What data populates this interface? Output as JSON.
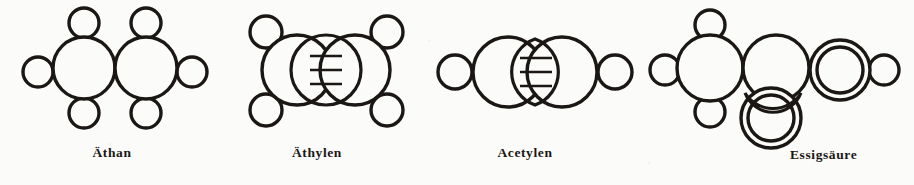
{
  "figure": {
    "background_color": "#fbfbfa",
    "ink_color": "#1a1714",
    "atom_fill": "#fbfbfa",
    "width": 914,
    "height": 185
  },
  "panels": [
    {
      "id": "aethan",
      "caption": "Äthan",
      "formula_note": "C2H6",
      "bond_type": "single",
      "carbon_count": 2,
      "hydrogen_count": 6,
      "oxygen_count": 0,
      "carbons": [
        {
          "cx": 84,
          "cy": 68,
          "r": 31,
          "rings": 1
        },
        {
          "cx": 146,
          "cy": 68,
          "r": 31,
          "rings": 1
        }
      ],
      "hydrogens": [
        {
          "cx": 84,
          "cy": 23,
          "r": 15
        },
        {
          "cx": 84,
          "cy": 113,
          "r": 15
        },
        {
          "cx": 38,
          "cy": 72,
          "r": 15
        },
        {
          "cx": 192,
          "cy": 72,
          "r": 15
        },
        {
          "cx": 146,
          "cy": 23,
          "r": 15
        },
        {
          "cx": 146,
          "cy": 113,
          "r": 15
        }
      ],
      "hatched_lens": null,
      "caption_x": 115,
      "caption_y": 150
    },
    {
      "id": "aethylen",
      "caption": "Äthylen",
      "formula_note": "C2H4",
      "bond_type": "double",
      "carbon_count": 2,
      "hydrogen_count": 4,
      "oxygen_count": 0,
      "carbons": [
        {
          "cx": 297,
          "cy": 70,
          "r": 35,
          "rings": 1
        },
        {
          "cx": 355,
          "cy": 70,
          "r": 35,
          "rings": 1
        }
      ],
      "hydrogens": [
        {
          "cx": 266,
          "cy": 32,
          "r": 16
        },
        {
          "cx": 266,
          "cy": 110,
          "r": 16
        },
        {
          "cx": 387,
          "cy": 32,
          "r": 16
        },
        {
          "cx": 387,
          "cy": 110,
          "r": 16
        }
      ],
      "hatched_lens": {
        "cx": 326,
        "cy": 70,
        "orientation": "vertical",
        "lines": 3
      },
      "caption_x": 326,
      "caption_y": 150
    },
    {
      "id": "acetylen",
      "caption": "Acetylen",
      "formula_note": "C2H2",
      "bond_type": "triple",
      "carbon_count": 2,
      "hydrogen_count": 2,
      "oxygen_count": 0,
      "carbons": [
        {
          "cx": 508,
          "cy": 72,
          "r": 35,
          "rings": 1
        },
        {
          "cx": 562,
          "cy": 72,
          "r": 35,
          "rings": 1
        }
      ],
      "hydrogens": [
        {
          "cx": 455,
          "cy": 72,
          "r": 17
        },
        {
          "cx": 615,
          "cy": 72,
          "r": 17
        }
      ],
      "hatched_lens": {
        "cx": 535,
        "cy": 72,
        "orientation": "vertical",
        "lines": 3
      },
      "caption_x": 535,
      "caption_y": 150
    },
    {
      "id": "essigsaeure",
      "caption": "Essigsäure",
      "formula_note": "CH3COOH",
      "bond_type": "mixed",
      "carbon_count": 2,
      "hydrogen_count": 4,
      "oxygen_count": 2,
      "carbons": [
        {
          "cx": 710,
          "cy": 68,
          "r": 33,
          "rings": 1
        },
        {
          "cx": 776,
          "cy": 68,
          "r": 33,
          "rings": 1
        }
      ],
      "hydrogens": [
        {
          "cx": 710,
          "cy": 25,
          "r": 15
        },
        {
          "cx": 710,
          "cy": 112,
          "r": 15
        },
        {
          "cx": 665,
          "cy": 70,
          "r": 15
        },
        {
          "cx": 884,
          "cy": 70,
          "r": 15
        }
      ],
      "oxygens": [
        {
          "cx": 840,
          "cy": 70,
          "r_outer": 30,
          "r_inner": 23,
          "rings": 2
        },
        {
          "cx": 771,
          "cy": 118,
          "r_outer": 30,
          "r_inner": 23,
          "rings": 2
        }
      ],
      "hatched_lens": {
        "cx": 774,
        "cy": 92,
        "orientation": "horizontal",
        "lines": 2
      },
      "caption_x": 790,
      "caption_y": 152
    }
  ]
}
